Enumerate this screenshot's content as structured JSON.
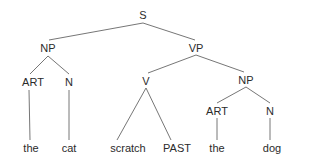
{
  "tree": {
    "nodes": {
      "s": {
        "label": "S",
        "x": 143,
        "y": 15
      },
      "np1": {
        "label": "NP",
        "x": 48,
        "y": 48
      },
      "vp": {
        "label": "VP",
        "x": 196,
        "y": 48
      },
      "art1": {
        "label": "ART",
        "x": 33,
        "y": 82
      },
      "n1": {
        "label": "N",
        "x": 69,
        "y": 82
      },
      "v": {
        "label": "V",
        "x": 146,
        "y": 81
      },
      "np2": {
        "label": "NP",
        "x": 246,
        "y": 80
      },
      "art2": {
        "label": "ART",
        "x": 217,
        "y": 111
      },
      "n2": {
        "label": "N",
        "x": 270,
        "y": 111
      },
      "w_the1": {
        "label": "the",
        "x": 31,
        "y": 148
      },
      "w_cat": {
        "label": "cat",
        "x": 69,
        "y": 148
      },
      "w_scratch": {
        "label": "scratch",
        "x": 128,
        "y": 148
      },
      "w_past": {
        "label": "PAST",
        "x": 177,
        "y": 148
      },
      "w_the2": {
        "label": "the",
        "x": 217,
        "y": 148
      },
      "w_dog": {
        "label": "dog",
        "x": 272,
        "y": 148
      }
    },
    "line_color": "#555555",
    "text_color": "#2b2b2b"
  }
}
